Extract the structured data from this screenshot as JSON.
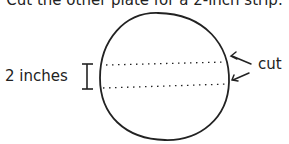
{
  "caption": "Cut the other plate for a 2-inch strip.",
  "labels": {
    "dimension": "2 inches",
    "cut": "cut"
  },
  "icons": {
    "plate": "circle-outline",
    "dimension_marker": "i-beam-bracket",
    "cut_lines": "dotted-lines",
    "arrows": "left-pointing-arrows"
  },
  "colors": {
    "stroke": "#222222",
    "background": "#ffffff"
  }
}
